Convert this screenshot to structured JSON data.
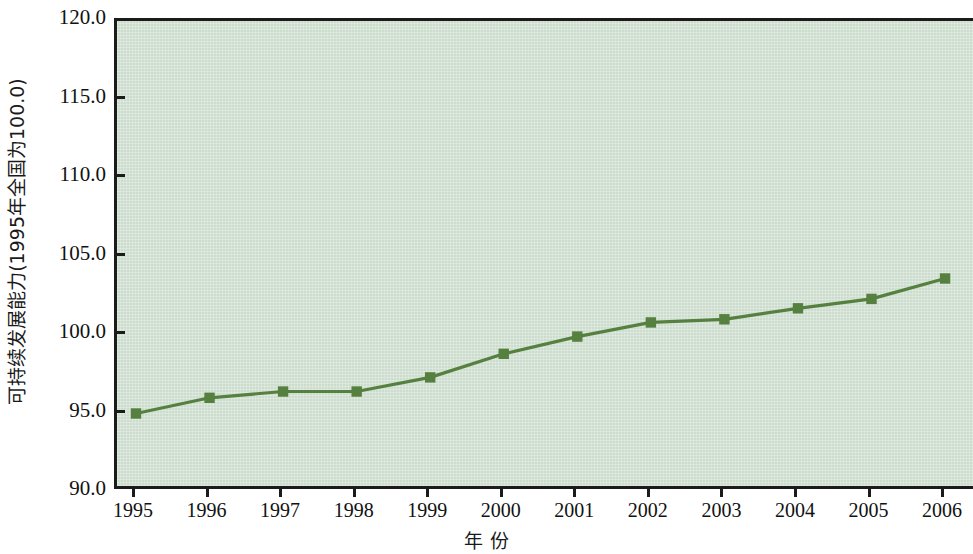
{
  "chart_data": {
    "type": "line",
    "title": "",
    "subtitle": "",
    "xlabel": "年  份",
    "ylabel": "可持续发展能力(1995年全国为100.0)",
    "categories": [
      "1995",
      "1996",
      "1997",
      "1998",
      "1999",
      "2000",
      "2001",
      "2002",
      "2003",
      "2004",
      "2005",
      "2006"
    ],
    "x": [
      1995,
      1996,
      1997,
      1998,
      1999,
      2000,
      2001,
      2002,
      2003,
      2004,
      2005,
      2006
    ],
    "series": [
      {
        "name": "可持续发展能力",
        "values": [
          95.0,
          96.0,
          96.4,
          96.4,
          97.3,
          98.8,
          99.9,
          100.8,
          101.0,
          101.7,
          102.3,
          103.6
        ],
        "color": "#55803f",
        "marker": "square"
      }
    ],
    "ylim": [
      90.0,
      120.0
    ],
    "yticks": [
      90.0,
      95.0,
      100.0,
      105.0,
      110.0,
      115.0,
      120.0
    ],
    "ytick_labels": [
      "90.0",
      "95.0",
      "100.0",
      "105.0",
      "110.0",
      "115.0",
      "120.0"
    ],
    "xtick_labels": [
      "1995",
      "1996",
      "1997",
      "1998",
      "1999",
      "2000",
      "2001",
      "2002",
      "2003",
      "2004",
      "2005",
      "2006"
    ],
    "grid": false,
    "legend": null,
    "legend_position": "none",
    "plot_background": "#ccdccd",
    "axis_color": "#1b1b1b",
    "annotations": []
  }
}
